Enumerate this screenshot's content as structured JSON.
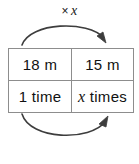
{
  "diagram": {
    "type": "ratio-table-with-multiplier-arcs",
    "top_arc": {
      "label_times_sign": "×",
      "label_variable": "x",
      "direction": "left-to-right",
      "curve": "arc-above",
      "arrowhead": "right-end-pointing-down-right"
    },
    "bottom_arc": {
      "label_times_sign": "×",
      "label_variable": "x",
      "direction": "left-to-right",
      "curve": "arc-below",
      "arrowhead": "right-end-pointing-up-right"
    },
    "table": {
      "rows": [
        {
          "left": {
            "value": "18 m",
            "variable": ""
          },
          "right": {
            "value": "15 m",
            "variable": ""
          }
        },
        {
          "left": {
            "value": "1 time",
            "variable": ""
          },
          "right": {
            "value": "times",
            "variable": "x"
          }
        }
      ]
    },
    "colors": {
      "border": "#8d8d8d",
      "text": "#111111",
      "arc": "#3d3d3d",
      "background": "#ffffff"
    }
  }
}
